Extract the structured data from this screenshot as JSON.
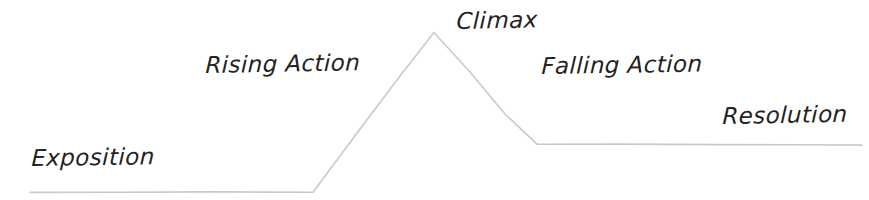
{
  "diagram": {
    "type": "plot-diagram",
    "background_color": "#ffffff",
    "line_color": "#c9c9c9",
    "line_width": 1.6,
    "text_color": "#232323",
    "canvas": {
      "width": 869,
      "height": 200
    },
    "labels": [
      {
        "id": "exposition",
        "text": "Exposition",
        "x": 31,
        "y": 147
      },
      {
        "id": "rising_action",
        "text": "Rising Action",
        "x": 205,
        "y": 54
      },
      {
        "id": "climax",
        "text": "Climax",
        "x": 456,
        "y": 10
      },
      {
        "id": "falling_action",
        "text": "Falling Action",
        "x": 541,
        "y": 55
      },
      {
        "id": "resolution",
        "text": "Resolution",
        "x": 722,
        "y": 105
      }
    ],
    "arc_points": [
      {
        "name": "start",
        "x": 30,
        "y": 192
      },
      {
        "name": "exposition-end",
        "x": 313,
        "y": 192
      },
      {
        "name": "climax-peak",
        "x": 434,
        "y": 32
      },
      {
        "name": "falling-action-end",
        "x": 537,
        "y": 144
      },
      {
        "name": "end",
        "x": 862,
        "y": 145
      }
    ],
    "path_d": "M 30 192.4 L 120 192.2 L 210 191.9 L 313 192.2 L 360 129 L 400 76 L 434 32.5 L 470 72 L 505 114 L 537 144.2 L 620 144.1 L 720 144.6 L 800 144.8 L 862 145.1"
  },
  "chart_data": {
    "type": "line",
    "xlabel": "",
    "ylabel": "",
    "x": [
      30,
      313,
      434,
      537,
      862
    ],
    "values": [
      0,
      0,
      100,
      30,
      29
    ],
    "categories": [
      "Exposition",
      "Rising Action",
      "Climax",
      "Falling Action",
      "Resolution"
    ],
    "annotations": [
      "Exposition",
      "Rising Action",
      "Climax",
      "Falling Action",
      "Resolution"
    ],
    "grid": false,
    "legend": "none"
  }
}
